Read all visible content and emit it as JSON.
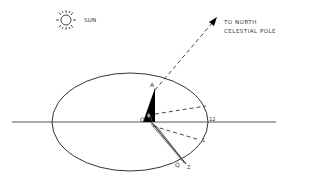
{
  "diagram": {
    "type": "astronomy-sketch",
    "colors": {
      "ink": "#333333",
      "fill_dark": "#000000",
      "fill_light": "#d8d8d8",
      "background": "#ffffff"
    },
    "sun": {
      "icon": "sun-icon",
      "label": "SUN"
    },
    "pole_arrow": {
      "line1": "TO NORTH",
      "line2": "CELESTIAL POLE"
    },
    "points": {
      "origin": "O",
      "top": "A",
      "angle": "ϕ",
      "hour_12": "12",
      "hour_1": "1",
      "q": "Q",
      "z": "Z"
    }
  }
}
